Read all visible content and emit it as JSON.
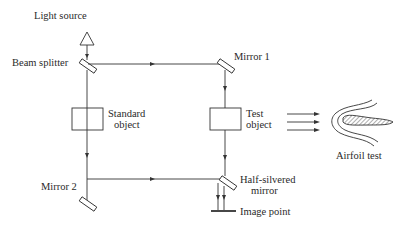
{
  "diagram": {
    "type": "Mach-Zehnder interferometer schematic",
    "labels": {
      "light_source": "Light source",
      "beam_splitter": "Beam splitter",
      "mirror_1": "Mirror 1",
      "standard_object_line1": "Standard",
      "standard_object_line2": "object",
      "test_object_line1": "Test",
      "test_object_line2": "object",
      "mirror_2": "Mirror 2",
      "half_silvered_line1": "Half-silvered",
      "half_silvered_line2": "mirror",
      "image_point": "Image point",
      "airfoil_test": "Airfoil test"
    },
    "colors": {
      "line": "#333333",
      "text": "#2a2a2a",
      "background": "#ffffff"
    }
  }
}
